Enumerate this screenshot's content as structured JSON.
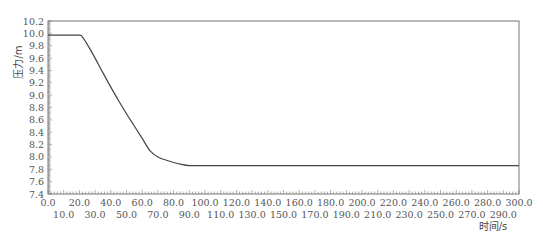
{
  "chart_data": {
    "type": "line",
    "title": "",
    "xlabel": "时间/s",
    "ylabel": "压力/m",
    "xlim": [
      0,
      300
    ],
    "ylim": [
      7.4,
      10.2
    ],
    "grid": false,
    "legend": null,
    "x_ticks_upper": [
      "0.0",
      "20.0",
      "40.0",
      "60.0",
      "80.0",
      "100.0",
      "120.0",
      "140.0",
      "160.0",
      "180.0",
      "200.0",
      "220.0",
      "240.0",
      "260.0",
      "280.0",
      "300.0"
    ],
    "x_ticks_lower": [
      "10.0",
      "30.0",
      "50.0",
      "70.0",
      "90.0",
      "110.0",
      "130.0",
      "150.0",
      "170.0",
      "190.0",
      "210.0",
      "230.0",
      "250.0",
      "270.0",
      "290.0"
    ],
    "y_ticks": [
      "10.2",
      "10.0",
      "9.8",
      "9.6",
      "9.4",
      "9.2",
      "9.0",
      "8.8",
      "8.6",
      "8.4",
      "8.2",
      "8.0",
      "7.8",
      "7.6",
      "7.4"
    ],
    "series": [
      {
        "name": "压力",
        "color": "#444444",
        "x": [
          0,
          10,
          20,
          22,
          25,
          30,
          35,
          40,
          45,
          50,
          55,
          60,
          65,
          70,
          75,
          80,
          85,
          90,
          100,
          150,
          200,
          250,
          300
        ],
        "y": [
          9.97,
          9.97,
          9.97,
          9.94,
          9.82,
          9.6,
          9.36,
          9.13,
          8.91,
          8.7,
          8.5,
          8.3,
          8.1,
          8.0,
          7.95,
          7.91,
          7.88,
          7.86,
          7.86,
          7.86,
          7.86,
          7.86,
          7.86
        ]
      }
    ]
  }
}
